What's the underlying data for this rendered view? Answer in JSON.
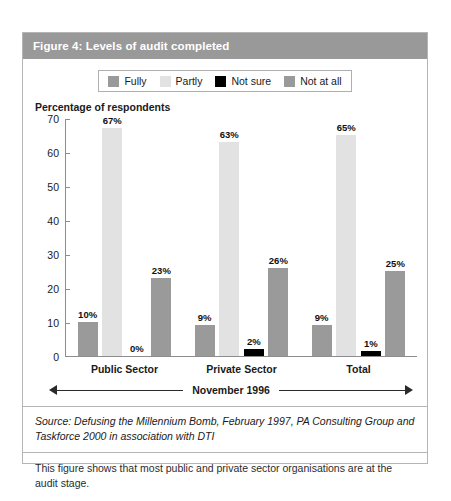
{
  "figure": {
    "title": "Figure 4: Levels of audit completed",
    "axis_title": "Percentage of respondents",
    "period_label": "November 1996",
    "source": "Source:  Defusing the Millennium Bomb, February 1997, PA Consulting Group and Taskforce 2000 in association with DTI",
    "note": "This figure shows that most public and private sector organisations are at the audit stage."
  },
  "colors": {
    "title_bar": "#999999",
    "fully": "#9a9a9a",
    "partly": "#e2e2e2",
    "not_sure": "#000000",
    "not_at_all": "#9a9a9a",
    "frame_border": "#b5b5b5",
    "axis": "#8d8d8d"
  },
  "chart_data": {
    "type": "bar",
    "title": "Figure 4: Levels of audit completed",
    "xlabel": "November 1996",
    "ylabel": "Percentage of respondents",
    "ylim": [
      0,
      70
    ],
    "yticks": [
      0,
      10,
      20,
      30,
      40,
      50,
      60,
      70
    ],
    "ytick_labels": [
      "0",
      "10",
      "20",
      "30",
      "40",
      "50",
      "60",
      "70"
    ],
    "grid": false,
    "legend_position": "top-center",
    "categories": [
      "Public Sector",
      "Private Sector",
      "Total"
    ],
    "series": [
      {
        "name": "Fully",
        "color": "#9a9a9a",
        "values": [
          10,
          9,
          9
        ],
        "labels": [
          "10%",
          "9%",
          "9%"
        ]
      },
      {
        "name": "Partly",
        "color": "#e2e2e2",
        "values": [
          67,
          63,
          65
        ],
        "labels": [
          "67%",
          "63%",
          "65%"
        ]
      },
      {
        "name": "Not sure",
        "color": "#000000",
        "values": [
          0,
          2,
          1
        ],
        "labels": [
          "0%",
          "2%",
          "1%"
        ]
      },
      {
        "name": "Not at all",
        "color": "#9a9a9a",
        "values": [
          23,
          26,
          25
        ],
        "labels": [
          "23%",
          "26%",
          "25%"
        ]
      }
    ]
  }
}
